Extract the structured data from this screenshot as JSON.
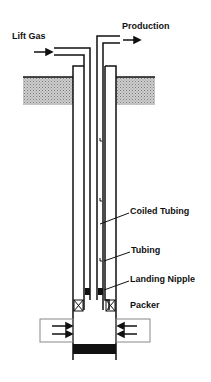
{
  "diagram": {
    "labels": {
      "lift_gas": "Lift Gas",
      "production": "Production",
      "coiled_tubing": "Coiled Tubing",
      "tubing": "Tubing",
      "landing_nipple": "Landing Nipple",
      "packer": "Packer"
    },
    "colors": {
      "line": "#111111",
      "ground_fill": "#b8b8b8",
      "perforation_box": "#888888",
      "plug": "#111111"
    }
  }
}
